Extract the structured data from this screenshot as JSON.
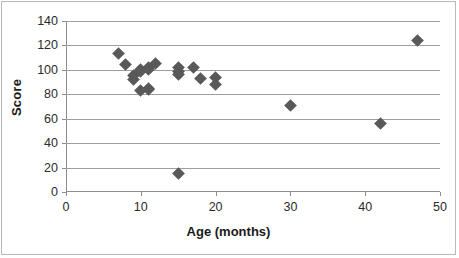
{
  "chart_data": {
    "type": "scatter",
    "title": "",
    "xlabel": "Age (months)",
    "ylabel": "Score",
    "xlim": [
      0,
      50
    ],
    "ylim": [
      0,
      140
    ],
    "xticks": [
      0,
      10,
      20,
      30,
      40,
      50
    ],
    "yticks": [
      0,
      20,
      40,
      60,
      80,
      100,
      120,
      140
    ],
    "grid": "horizontal",
    "legend": "none",
    "series_name": "Score vs Age",
    "marker": "diamond",
    "marker_color": "#595959",
    "points": [
      {
        "x": 7,
        "y": 113
      },
      {
        "x": 8,
        "y": 104
      },
      {
        "x": 9,
        "y": 95
      },
      {
        "x": 9,
        "y": 92
      },
      {
        "x": 10,
        "y": 100
      },
      {
        "x": 10,
        "y": 99
      },
      {
        "x": 10,
        "y": 83
      },
      {
        "x": 11,
        "y": 102
      },
      {
        "x": 11,
        "y": 100
      },
      {
        "x": 11,
        "y": 85
      },
      {
        "x": 11,
        "y": 84
      },
      {
        "x": 12,
        "y": 105
      },
      {
        "x": 15,
        "y": 102
      },
      {
        "x": 15,
        "y": 99
      },
      {
        "x": 15,
        "y": 96
      },
      {
        "x": 15,
        "y": 15
      },
      {
        "x": 17,
        "y": 102
      },
      {
        "x": 18,
        "y": 93
      },
      {
        "x": 20,
        "y": 94
      },
      {
        "x": 20,
        "y": 88
      },
      {
        "x": 30,
        "y": 71
      },
      {
        "x": 42,
        "y": 56
      },
      {
        "x": 47,
        "y": 124
      }
    ]
  }
}
